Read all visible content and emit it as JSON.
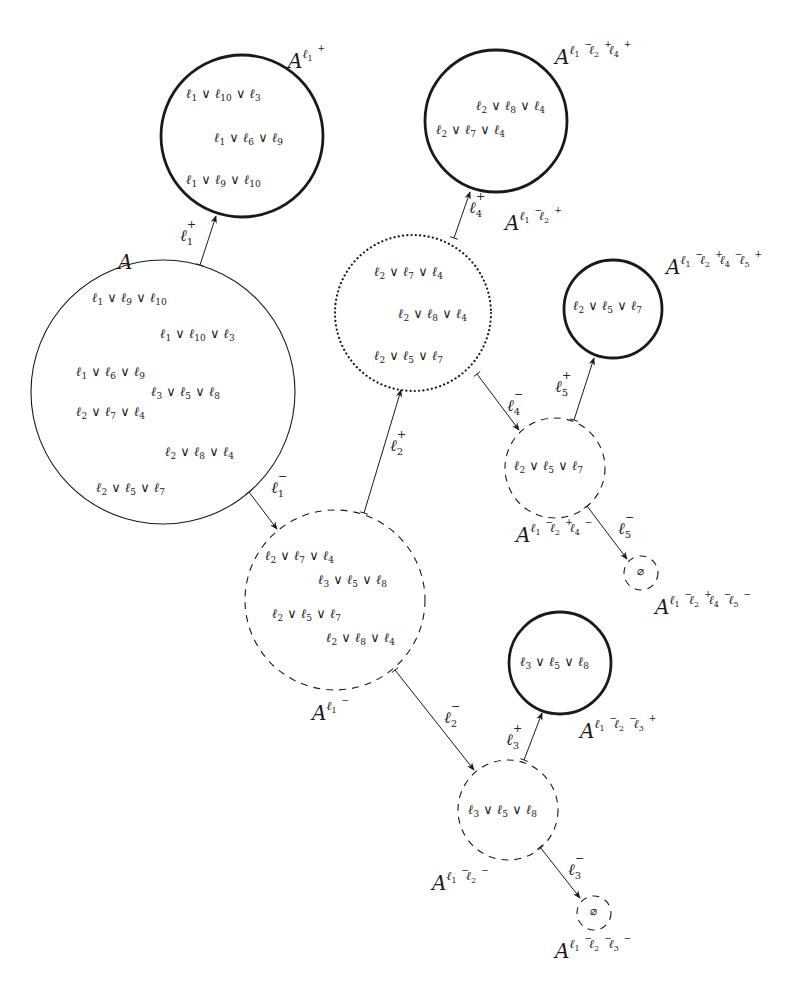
{
  "diagram": {
    "nodes": [
      {
        "id": "A",
        "label_base": "A",
        "label_literals": [],
        "style": "thin-solid",
        "cx": 163,
        "cy": 392,
        "r": 132,
        "label_pos": [
          118,
          262
        ],
        "clauses": [
          {
            "text": "ℓ1 ∨ ℓ9 ∨ ℓ10",
            "lits": [
              "1",
              "9",
              "10"
            ],
            "pos": [
              92,
              298
            ]
          },
          {
            "text": "ℓ1 ∨ ℓ10 ∨ ℓ3",
            "lits": [
              "1",
              "10",
              "3"
            ],
            "pos": [
              160,
              334
            ]
          },
          {
            "text": "ℓ1 ∨ ℓ6 ∨ ℓ9",
            "lits": [
              "1",
              "6",
              "9"
            ],
            "pos": [
              76,
              372
            ]
          },
          {
            "text": "ℓ3 ∨ ℓ5 ∨ ℓ8",
            "lits": [
              "3",
              "5",
              "8"
            ],
            "pos": [
              151,
              392
            ]
          },
          {
            "text": "ℓ2 ∨ ℓ7 ∨ ℓ4",
            "lits": [
              "2",
              "7",
              "4"
            ],
            "pos": [
              76,
              412
            ]
          },
          {
            "text": "ℓ2 ∨ ℓ8 ∨ ℓ4",
            "lits": [
              "2",
              "8",
              "4"
            ],
            "pos": [
              165,
              452
            ]
          },
          {
            "text": "ℓ2 ∨ ℓ5 ∨ ℓ7",
            "lits": [
              "2",
              "5",
              "7"
            ],
            "pos": [
              96,
              488
            ]
          }
        ]
      },
      {
        "id": "A_l1p",
        "label_base": "A",
        "label_literals": [
          {
            "idx": "1",
            "sign": "+"
          }
        ],
        "style": "thick-solid",
        "cx": 242,
        "cy": 136,
        "r": 81,
        "label_pos": [
          288,
          58
        ],
        "clauses": [
          {
            "text": "ℓ1 ∨ ℓ10 ∨ ℓ3",
            "lits": [
              "1",
              "10",
              "3"
            ],
            "pos": [
              186,
              94
            ]
          },
          {
            "text": "ℓ1 ∨ ℓ6 ∨ ℓ9",
            "lits": [
              "1",
              "6",
              "9"
            ],
            "pos": [
              214,
              138
            ]
          },
          {
            "text": "ℓ1 ∨ ℓ9 ∨ ℓ10",
            "lits": [
              "1",
              "9",
              "10"
            ],
            "pos": [
              186,
              180
            ]
          }
        ]
      },
      {
        "id": "A_l1m",
        "label_base": "A",
        "label_literals": [
          {
            "idx": "1",
            "sign": "−"
          }
        ],
        "style": "dashed",
        "cx": 335,
        "cy": 600,
        "r": 90,
        "label_pos": [
          312,
          710
        ],
        "clauses": [
          {
            "text": "ℓ2 ∨ ℓ7 ∨ ℓ4",
            "lits": [
              "2",
              "7",
              "4"
            ],
            "pos": [
              265,
              556
            ]
          },
          {
            "text": "ℓ3 ∨ ℓ5 ∨ ℓ8",
            "lits": [
              "3",
              "5",
              "8"
            ],
            "pos": [
              318,
              580
            ]
          },
          {
            "text": "ℓ2 ∨ ℓ5 ∨ ℓ7",
            "lits": [
              "2",
              "5",
              "7"
            ],
            "pos": [
              272,
              614
            ]
          },
          {
            "text": "ℓ2 ∨ ℓ8 ∨ ℓ4",
            "lits": [
              "2",
              "8",
              "4"
            ],
            "pos": [
              326,
              638
            ]
          }
        ]
      },
      {
        "id": "A_l1m_l2p",
        "label_base": "A",
        "label_literals": [
          {
            "idx": "1",
            "sign": "−"
          },
          {
            "idx": "2",
            "sign": "+"
          }
        ],
        "style": "dotted",
        "cx": 413,
        "cy": 313,
        "r": 78,
        "label_pos": [
          505,
          220
        ],
        "clauses": [
          {
            "text": "ℓ2 ∨ ℓ7 ∨ ℓ4",
            "lits": [
              "2",
              "7",
              "4"
            ],
            "pos": [
              374,
              272
            ]
          },
          {
            "text": "ℓ2 ∨ ℓ8 ∨ ℓ4",
            "lits": [
              "2",
              "8",
              "4"
            ],
            "pos": [
              398,
              314
            ]
          },
          {
            "text": "ℓ2 ∨ ℓ5 ∨ ℓ7",
            "lits": [
              "2",
              "5",
              "7"
            ],
            "pos": [
              374,
              356
            ]
          }
        ]
      },
      {
        "id": "A_l1m_l2p_l4p",
        "label_base": "A",
        "label_literals": [
          {
            "idx": "1",
            "sign": "−"
          },
          {
            "idx": "2",
            "sign": "+"
          },
          {
            "idx": "4",
            "sign": "+"
          }
        ],
        "style": "thick-solid",
        "cx": 496,
        "cy": 121,
        "r": 71,
        "label_pos": [
          555,
          54
        ],
        "clauses": [
          {
            "text": "ℓ2 ∨ ℓ8 ∨ ℓ4",
            "lits": [
              "2",
              "8",
              "4"
            ],
            "pos": [
              476,
              106
            ]
          },
          {
            "text": "ℓ2 ∨ ℓ7 ∨ ℓ4",
            "lits": [
              "2",
              "7",
              "4"
            ],
            "pos": [
              436,
              130
            ]
          }
        ]
      },
      {
        "id": "A_l1m_l2p_l4m",
        "label_base": "A",
        "label_literals": [
          {
            "idx": "1",
            "sign": "−"
          },
          {
            "idx": "2",
            "sign": "+"
          },
          {
            "idx": "4",
            "sign": "−"
          }
        ],
        "style": "dashed",
        "cx": 555,
        "cy": 468,
        "r": 50,
        "label_pos": [
          516,
          532
        ],
        "clauses": [
          {
            "text": "ℓ2 ∨ ℓ5 ∨ ℓ7",
            "lits": [
              "2",
              "5",
              "7"
            ],
            "pos": [
              514,
              466
            ]
          }
        ]
      },
      {
        "id": "A_l1m_l2p_l4m_l5p",
        "label_base": "A",
        "label_literals": [
          {
            "idx": "1",
            "sign": "−"
          },
          {
            "idx": "2",
            "sign": "+"
          },
          {
            "idx": "4",
            "sign": "−"
          },
          {
            "idx": "5",
            "sign": "+"
          }
        ],
        "style": "thick-solid",
        "cx": 613,
        "cy": 309,
        "r": 49,
        "label_pos": [
          666,
          264
        ],
        "clauses": [
          {
            "text": "ℓ2 ∨ ℓ5 ∨ ℓ7",
            "lits": [
              "2",
              "5",
              "7"
            ],
            "pos": [
              573,
              306
            ]
          }
        ]
      },
      {
        "id": "A_l1m_l2p_l4m_l5m",
        "label_base": "A",
        "label_literals": [
          {
            "idx": "1",
            "sign": "−"
          },
          {
            "idx": "2",
            "sign": "+"
          },
          {
            "idx": "4",
            "sign": "−"
          },
          {
            "idx": "5",
            "sign": "−"
          }
        ],
        "style": "dashed",
        "cx": 641,
        "cy": 573,
        "r": 17,
        "label_pos": [
          655,
          604
        ],
        "clauses": [],
        "empty_set": "∅"
      },
      {
        "id": "A_l1m_l2m_l3p",
        "label_base": "A",
        "label_literals": [
          {
            "idx": "1",
            "sign": "−"
          },
          {
            "idx": "2",
            "sign": "−"
          },
          {
            "idx": "3",
            "sign": "+"
          }
        ],
        "style": "thick-solid",
        "cx": 560,
        "cy": 663,
        "r": 51,
        "label_pos": [
          580,
          728
        ],
        "clauses": [
          {
            "text": "ℓ3 ∨ ℓ5 ∨ ℓ8",
            "lits": [
              "3",
              "5",
              "8"
            ],
            "pos": [
              520,
              662
            ]
          }
        ]
      },
      {
        "id": "A_l1m_l2m",
        "label_base": "A",
        "label_literals": [
          {
            "idx": "1",
            "sign": "−"
          },
          {
            "idx": "2",
            "sign": "−"
          }
        ],
        "style": "dashed",
        "cx": 508,
        "cy": 810,
        "r": 50,
        "label_pos": [
          432,
          880
        ],
        "clauses": [
          {
            "text": "ℓ3 ∨ ℓ5 ∨ ℓ8",
            "lits": [
              "3",
              "5",
              "8"
            ],
            "pos": [
              468,
              810
            ]
          }
        ]
      },
      {
        "id": "A_l1m_l2m_l3m",
        "label_base": "A",
        "label_literals": [
          {
            "idx": "1",
            "sign": "−"
          },
          {
            "idx": "2",
            "sign": "−"
          },
          {
            "idx": "3",
            "sign": "−"
          }
        ],
        "style": "dashed",
        "cx": 594,
        "cy": 913,
        "r": 17,
        "label_pos": [
          555,
          948
        ],
        "clauses": [],
        "empty_set": "∅"
      }
    ],
    "edges": [
      {
        "from": "A",
        "to": "A_l1p",
        "label": {
          "idx": "1",
          "sign": "+"
        },
        "x1": 200,
        "y1": 265,
        "x2": 216,
        "y2": 216,
        "label_pos": [
          180,
          236
        ]
      },
      {
        "from": "A",
        "to": "A_l1m",
        "label": {
          "idx": "1",
          "sign": "−"
        },
        "x1": 249,
        "y1": 492,
        "x2": 277,
        "y2": 529,
        "label_pos": [
          271,
          488
        ]
      },
      {
        "from": "A_l1m",
        "to": "A_l1m_l2p",
        "label": {
          "idx": "2",
          "sign": "+"
        },
        "x1": 364,
        "y1": 513,
        "x2": 401,
        "y2": 390,
        "label_pos": [
          390,
          446
        ]
      },
      {
        "from": "A_l1m_l2p",
        "to": "A_l1m_l2p_l4p",
        "label": {
          "idx": "4",
          "sign": "+"
        },
        "x1": 454,
        "y1": 238,
        "x2": 470,
        "y2": 192,
        "label_pos": [
          469,
          208
        ]
      },
      {
        "from": "A_l1m_l2p",
        "to": "A_l1m_l2p_l4m",
        "label": {
          "idx": "4",
          "sign": "−"
        },
        "x1": 477,
        "y1": 374,
        "x2": 519,
        "y2": 430,
        "label_pos": [
          507,
          406
        ]
      },
      {
        "from": "A_l1m_l2p_l4m",
        "to": "A_l1m_l2p_l4m_l5p",
        "label": {
          "idx": "5",
          "sign": "+"
        },
        "x1": 574,
        "y1": 420,
        "x2": 594,
        "y2": 358,
        "label_pos": [
          555,
          387
        ]
      },
      {
        "from": "A_l1m_l2p_l4m",
        "to": "A_l1m_l2p_l4m_l5m",
        "label": {
          "idx": "5",
          "sign": "−"
        },
        "x1": 587,
        "y1": 506,
        "x2": 627,
        "y2": 559,
        "label_pos": [
          618,
          529
        ]
      },
      {
        "from": "A_l1m",
        "to": "A_l1m_l2m",
        "label": {
          "idx": "2",
          "sign": "−"
        },
        "x1": 395,
        "y1": 670,
        "x2": 474,
        "y2": 770,
        "label_pos": [
          444,
          718
        ]
      },
      {
        "from": "A_l1m_l2m",
        "to": "A_l1m_l2m_l3p",
        "label": {
          "idx": "3",
          "sign": "+"
        },
        "x1": 524,
        "y1": 760,
        "x2": 542,
        "y2": 713,
        "label_pos": [
          506,
          740
        ]
      },
      {
        "from": "A_l1m_l2m",
        "to": "A_l1m_l2m_l3m",
        "label": {
          "idx": "3",
          "sign": "−"
        },
        "x1": 540,
        "y1": 847,
        "x2": 580,
        "y2": 898,
        "label_pos": [
          568,
          870
        ]
      }
    ]
  }
}
